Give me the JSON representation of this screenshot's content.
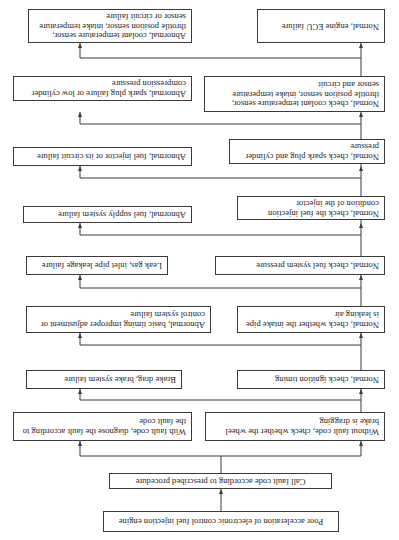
{
  "diagram": {
    "orientation": "rotated 180 degrees",
    "nodes": {
      "root": "Poor acceleration of electronic control fuel injection engine",
      "call_code": "Call fault code according to prescribed procedure",
      "with_code": "With fault code, diagnose the fault according to the fault code",
      "without_code": "Without fault code, check whether the wheel brake is dragging",
      "brake_drag": "Brake drag, brake system failure",
      "check_ignition": "Normal, check ignition timing",
      "timing_abnormal": "Abnormal, basic timing improper adjustment or control system failure",
      "check_intake": "Normal, check whether the intake pipe is leaking air",
      "leak_gas": "Leak gas, inlet pipe leakage failure",
      "check_fuel_pressure": "Normal, check fuel system pressure",
      "fuel_supply_abnormal": "Abnormal, fuel supply system failure",
      "check_injection": "Normal, check the fuel injection condition of the injector",
      "injector_abnormal": "Abnormal, fuel injector or its circuit failure",
      "check_spark": "Normal, check spark plug and cylinder pressure",
      "spark_abnormal": "Abnormal, spark plug failure or low cylinder compression pressure",
      "check_sensors": "Normal, check coolant temperature sensor, throttle position sensor, intake temperature sensor and circuit",
      "sensors_abnormal": "Abnormal, coolant temperature sensor, throttle position sensor, intake temperature sensor or circuit failure",
      "ecu_failure": "Normal, engine ECU failure"
    },
    "edges": [
      [
        "root",
        "call_code"
      ],
      [
        "call_code",
        "with_code"
      ],
      [
        "call_code",
        "without_code"
      ],
      [
        "without_code",
        "brake_drag"
      ],
      [
        "without_code",
        "check_ignition"
      ],
      [
        "check_ignition",
        "timing_abnormal"
      ],
      [
        "check_ignition",
        "check_intake"
      ],
      [
        "check_intake",
        "leak_gas"
      ],
      [
        "check_intake",
        "check_fuel_pressure"
      ],
      [
        "check_fuel_pressure",
        "fuel_supply_abnormal"
      ],
      [
        "check_fuel_pressure",
        "check_injection"
      ],
      [
        "check_injection",
        "injector_abnormal"
      ],
      [
        "check_injection",
        "check_spark"
      ],
      [
        "check_spark",
        "spark_abnormal"
      ],
      [
        "check_spark",
        "check_sensors"
      ],
      [
        "check_sensors",
        "sensors_abnormal"
      ],
      [
        "check_sensors",
        "ecu_failure"
      ]
    ]
  }
}
